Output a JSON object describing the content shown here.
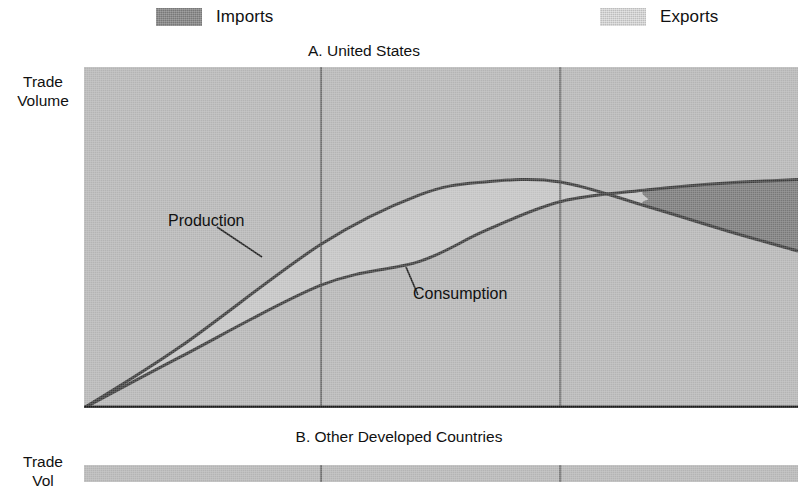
{
  "figure": {
    "legend": {
      "position": "top",
      "entries": [
        {
          "label": "Imports",
          "swatch_name": "imports-swatch",
          "color": "#787878"
        },
        {
          "label": "Exports",
          "swatch_name": "exports-swatch",
          "color": "#bdbdbd"
        }
      ]
    },
    "panels": [
      {
        "id": "A",
        "title": "A. United States",
        "ylabel_line1": "Trade",
        "ylabel_line2": "Volume",
        "annotations": [
          {
            "name": "production-label",
            "text": "Production"
          },
          {
            "name": "consumption-label",
            "text": "Consumption"
          }
        ]
      },
      {
        "id": "B",
        "title": "B. Other Developed Countries",
        "ylabel_line1": "Trade",
        "ylabel_line2": "Vol",
        "annotations": []
      }
    ],
    "colors": {
      "plot_background": "#b4b4b4",
      "exports_fill": "#c2c2c2",
      "imports_fill": "#787878",
      "curve_line": "#3b3b3b",
      "gridline": "#6e6e6e",
      "axis": "#1a1a1a",
      "page_background": "#ffffff"
    }
  },
  "chart_data": {
    "type": "area",
    "title": "A. United States",
    "subtitle": "B. Other Developed Countries",
    "xlabel": "",
    "ylabel": "Trade Volume",
    "grid": true,
    "gridlines_x": [
      0.332,
      0.667
    ],
    "legend_position": "top",
    "axis_ranges": {
      "xlim": [
        0,
        1
      ],
      "ylim": [
        0,
        1
      ]
    },
    "series": [
      {
        "name": "Production",
        "x": [
          0.0,
          0.135,
          0.332,
          0.47,
          0.562,
          0.667,
          0.79,
          0.9,
          1.0
        ],
        "y": [
          0.0,
          0.18,
          0.48,
          0.625,
          0.663,
          0.663,
          0.59,
          0.52,
          0.46
        ]
      },
      {
        "name": "Consumption",
        "x": [
          0.0,
          0.135,
          0.332,
          0.47,
          0.562,
          0.667,
          0.79,
          0.9,
          1.0
        ],
        "y": [
          0.0,
          0.15,
          0.36,
          0.43,
          0.52,
          0.605,
          0.64,
          0.66,
          0.67
        ]
      }
    ],
    "bands": [
      {
        "name": "Exports",
        "description": "Region where Production exceeds Consumption",
        "upper_series": "Production",
        "lower_series": "Consumption",
        "x_start": 0.0,
        "x_end": 0.79,
        "fill": "#c2c2c2"
      },
      {
        "name": "Imports",
        "description": "Region where Consumption exceeds Production",
        "upper_series": "Consumption",
        "lower_series": "Production",
        "x_start": 0.79,
        "x_end": 1.0,
        "fill": "#787878"
      }
    ],
    "crossover_point": {
      "x": 0.79,
      "y": 0.612
    },
    "annotations": [
      {
        "text": "Production",
        "points_to_series": "Production",
        "at_x": 0.316
      },
      {
        "text": "Consumption",
        "points_to_series": "Consumption",
        "at_x": 0.45
      }
    ]
  }
}
